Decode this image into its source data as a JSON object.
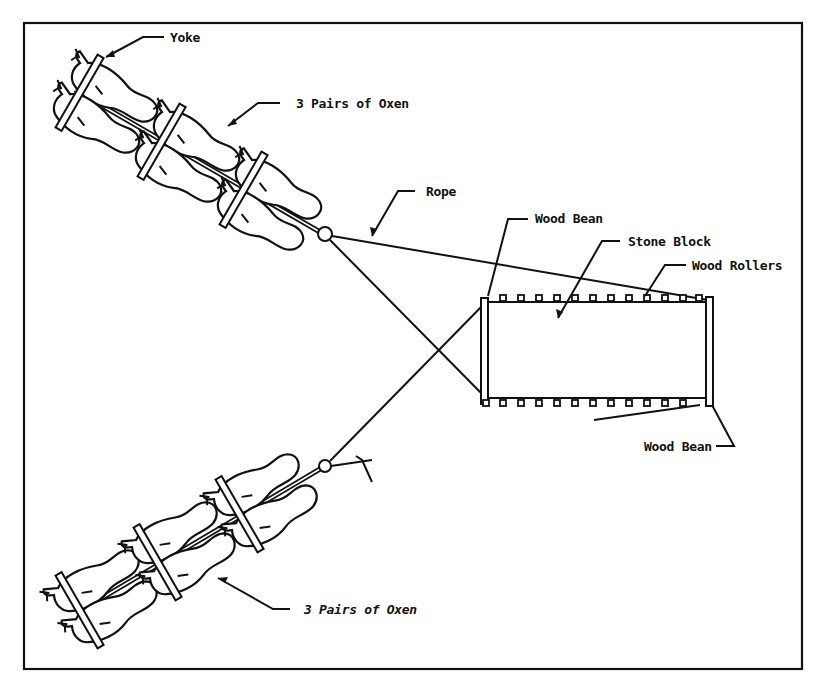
{
  "diagram": {
    "labels": {
      "yoke": "Yoke",
      "oxen_top": "3 Pairs of Oxen",
      "rope": "Rope",
      "wood_beam_top": "Wood Bean",
      "stone_block": "Stone Block",
      "wood_rollers": "Wood Rollers",
      "wood_beam_bottom": "Wood Bean",
      "oxen_bottom": "3 Pairs of Oxen"
    },
    "colors": {
      "line": "#111111",
      "background": "#ffffff"
    },
    "counts": {
      "oxen_pairs_per_team": 3,
      "teams": 2,
      "rollers_per_side": 12
    }
  }
}
